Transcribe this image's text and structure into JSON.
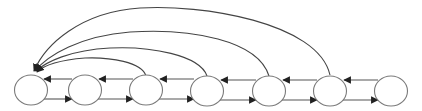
{
  "diagram": {
    "type": "state-chain",
    "colors": {
      "node_stroke": "#7a7a7a",
      "edge": "#555555",
      "arrowhead": "#222222",
      "background": "#ffffff"
    },
    "nodes": [
      {
        "id": "n1",
        "label": "",
        "cx": 31,
        "cy": 90
      },
      {
        "id": "n2",
        "label": "",
        "cx": 85,
        "cy": 90
      },
      {
        "id": "n3",
        "label": "",
        "cx": 146,
        "cy": 90
      },
      {
        "id": "n4",
        "label": "",
        "cx": 207,
        "cy": 90
      },
      {
        "id": "n5",
        "label": "",
        "cx": 269,
        "cy": 90
      },
      {
        "id": "n6",
        "label": "",
        "cx": 330,
        "cy": 90
      },
      {
        "id": "n7",
        "label": "",
        "cx": 391,
        "cy": 90
      }
    ],
    "edges_forward": [
      {
        "from": "n1",
        "to": "n2"
      },
      {
        "from": "n2",
        "to": "n3"
      },
      {
        "from": "n3",
        "to": "n4"
      },
      {
        "from": "n4",
        "to": "n5"
      },
      {
        "from": "n5",
        "to": "n6"
      },
      {
        "from": "n6",
        "to": "n7"
      }
    ],
    "edges_backward": [
      {
        "from": "n2",
        "to": "n1"
      },
      {
        "from": "n3",
        "to": "n2"
      },
      {
        "from": "n4",
        "to": "n3"
      },
      {
        "from": "n5",
        "to": "n4"
      },
      {
        "from": "n6",
        "to": "n5"
      },
      {
        "from": "n7",
        "to": "n6"
      }
    ],
    "edges_long_range": [
      {
        "from": "n3",
        "to": "n1"
      },
      {
        "from": "n4",
        "to": "n1"
      },
      {
        "from": "n5",
        "to": "n1"
      },
      {
        "from": "n6",
        "to": "n1"
      }
    ]
  }
}
